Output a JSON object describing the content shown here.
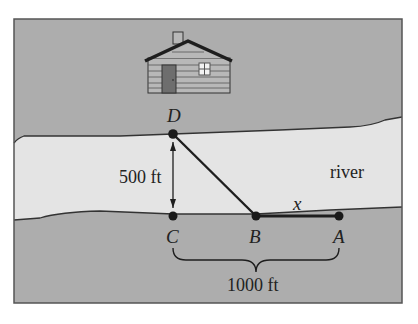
{
  "diagram": {
    "colors": {
      "land": "#adadad",
      "river": "#e4e4e4",
      "line": "#1e1e1e",
      "house_wall": "#b8b8b8",
      "door": "#6e6e6e",
      "window": "#f2f2f2",
      "frame": "#555555"
    },
    "points": [
      {
        "id": "D",
        "label": "D",
        "x": 173,
        "y": 134
      },
      {
        "id": "C",
        "label": "C",
        "x": 173,
        "y": 216
      },
      {
        "id": "B",
        "label": "B",
        "x": 256,
        "y": 216
      },
      {
        "id": "A",
        "label": "A",
        "x": 339,
        "y": 216
      }
    ],
    "labels": {
      "river": "river",
      "width": "500 ft",
      "distance": "1000 ft",
      "segment_x": "x"
    },
    "house": {
      "present": true
    }
  }
}
